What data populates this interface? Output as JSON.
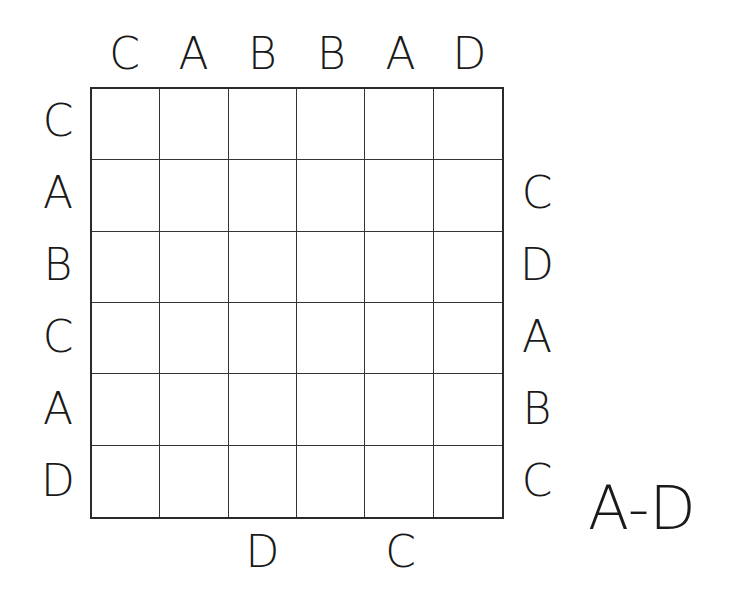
{
  "puzzle": {
    "size": 6,
    "letter_range": "A-D",
    "clues": {
      "top": [
        "C",
        "A",
        "B",
        "B",
        "A",
        "D"
      ],
      "left": [
        "C",
        "A",
        "B",
        "C",
        "A",
        "D"
      ],
      "right": [
        "",
        "C",
        "D",
        "A",
        "B",
        "C"
      ],
      "bottom": [
        "",
        "",
        "D",
        "",
        "C",
        ""
      ]
    },
    "cells": [
      [
        "",
        "",
        "",
        "",
        "",
        ""
      ],
      [
        "",
        "",
        "",
        "",
        "",
        ""
      ],
      [
        "",
        "",
        "",
        "",
        "",
        ""
      ],
      [
        "",
        "",
        "",
        "",
        "",
        ""
      ],
      [
        "",
        "",
        "",
        "",
        "",
        ""
      ],
      [
        "",
        "",
        "",
        "",
        "",
        ""
      ]
    ]
  }
}
